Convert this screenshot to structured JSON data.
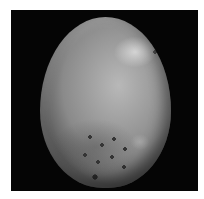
{
  "image": {
    "subject": "egg-shaped textured stone/fossil",
    "background": "black",
    "border": "white",
    "tone": "grayscale",
    "colors": {
      "background": "#050505",
      "subject_light": "#b8b8b8",
      "subject_dark": "#5a5a5a",
      "page": "#ffffff"
    }
  }
}
